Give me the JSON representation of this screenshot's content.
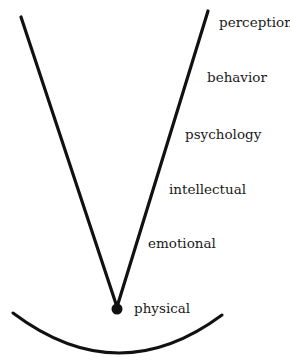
{
  "diagram": {
    "type": "v-cone",
    "colors": {
      "line": "#111111",
      "text": "#1a1a1a",
      "background": "#ffffff"
    },
    "labels": [
      {
        "id": "perception",
        "text": "perception",
        "x": 219,
        "y": 27
      },
      {
        "id": "behavior",
        "text": "behavior",
        "x": 207,
        "y": 82
      },
      {
        "id": "psychology",
        "text": "psychology",
        "x": 185,
        "y": 139
      },
      {
        "id": "intellectual",
        "text": "intellectual",
        "x": 169,
        "y": 194
      },
      {
        "id": "emotional",
        "text": "emotional",
        "x": 148,
        "y": 248
      },
      {
        "id": "physical",
        "text": "physical",
        "x": 134,
        "y": 313
      }
    ],
    "apex": {
      "x": 117,
      "y": 309,
      "r": 5.5
    },
    "left_line": {
      "x1": 21,
      "y1": 17,
      "x2": 117,
      "y2": 307
    },
    "right_line": {
      "x1": 208,
      "y1": 11,
      "x2": 117,
      "y2": 307
    },
    "arc": {
      "x1": 13,
      "y1": 313,
      "cx": 118,
      "cy": 392,
      "x2": 222,
      "y2": 315
    }
  }
}
